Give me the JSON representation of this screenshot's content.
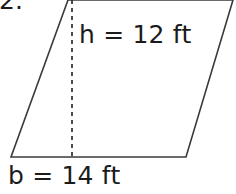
{
  "figure": {
    "kind": "parallelogram-area-diagram",
    "background_color": "#ffffff",
    "stroke_color": "#3a3a3a",
    "text_color": "#1b1b1b"
  },
  "problem": {
    "number_text": "2."
  },
  "labels": {
    "height_label": "h = 12 ft",
    "base_label": "b = 14 ft"
  },
  "measurements": {
    "height_value": "12",
    "height_unit": "ft",
    "base_value": "14",
    "base_unit": "ft"
  },
  "geometry": {
    "top_left": "68,0",
    "top_right": "233,0",
    "bottom_right": "186,157",
    "bottom_left": "11,157",
    "dashed_height_line": "72,0 72,157"
  }
}
